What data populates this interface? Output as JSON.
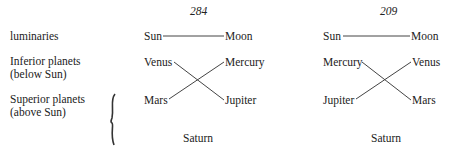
{
  "labels": {
    "luminaries": "luminaries",
    "inferior_line1": "Inferior planets",
    "inferior_line2": "(below Sun)",
    "superior_line1": "Superior planets",
    "superior_line2": "(above Sun)"
  },
  "diagrams": [
    {
      "year": "284",
      "top_left": "Sun",
      "top_right": "Moon",
      "mid_left": "Venus",
      "mid_right": "Mercury",
      "low_left": "Mars",
      "low_right": "Jupiter",
      "bottom": "Saturn"
    },
    {
      "year": "209",
      "top_left": "Sun",
      "top_right": "Moon",
      "mid_left": "Mercury",
      "mid_right": "Venus",
      "low_left": "Jupiter",
      "low_right": "Mars",
      "bottom": "Saturn"
    }
  ]
}
